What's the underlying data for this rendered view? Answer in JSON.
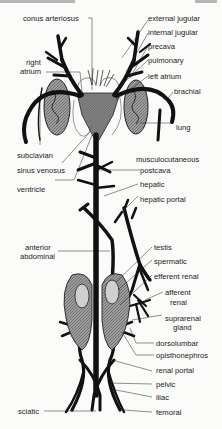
{
  "figure": {
    "header_fragment": ""
  },
  "labels": {
    "conus_arteriosus": "conus arteriosus",
    "external_jugular": "external jugular",
    "internal_jugular": "internal jugular",
    "precava": "precava",
    "right_atrium_1": "right",
    "right_atrium_2": "atrium",
    "pulmonary": "pulmonary",
    "left_atrium": "left atrium",
    "brachial": "brachial",
    "lung": "lung",
    "subclavian": "subclavian",
    "musculocutaneous": "musculocutaneous",
    "sinus_venosus": "sinus venosus",
    "postcava": "postcava",
    "ventricle": "ventricle",
    "hepatic": "hepatic",
    "hepatic_portal": "hepatic portal",
    "anterior_abdominal_1": "anterior",
    "anterior_abdominal_2": "abdominal",
    "testis": "testis",
    "spermatic": "spermatic",
    "efferent_renal": "efferent renal",
    "afferent_renal_1": "afferent",
    "afferent_renal_2": "renal",
    "suprarenal_gland_1": "suprarenal",
    "suprarenal_gland_2": "gland",
    "dorsolumbar": "dorsolumbar",
    "opisthonephros": "opisthonephros",
    "renal_portal": "renal portal",
    "pelvic": "pelvic",
    "iliac": "iliac",
    "sciatic": "sciatic",
    "femoral": "femoral"
  },
  "colors": {
    "ink": "#111111",
    "organ_fill": "#8a8a8a",
    "heart_fill": "#9a9a9a",
    "paper": "#fbfbfa"
  }
}
